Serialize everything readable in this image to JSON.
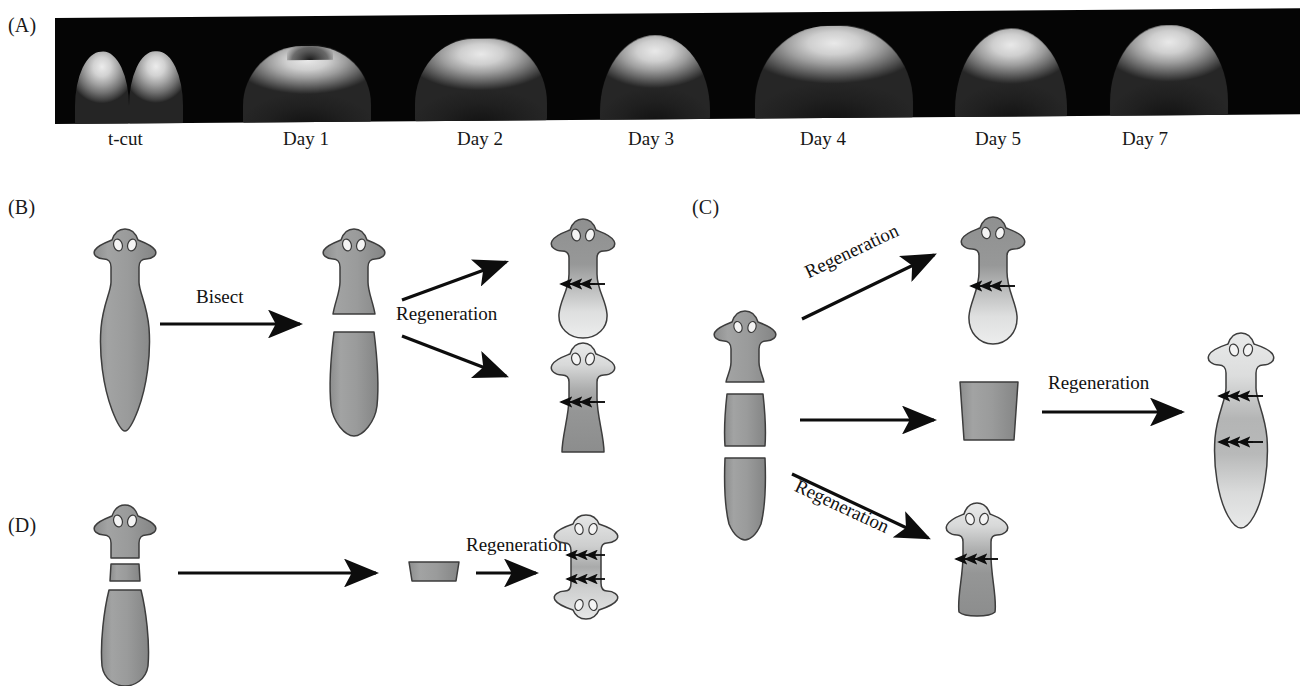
{
  "figure": {
    "panels": [
      {
        "id": "A",
        "letter": "(A)"
      },
      {
        "id": "B",
        "letter": "(B)"
      },
      {
        "id": "C",
        "letter": "(C)"
      },
      {
        "id": "D",
        "letter": "(D)"
      }
    ]
  },
  "panelA": {
    "letter": "(A)",
    "description": "Time-course micrographs of a planarian head regenerating after a transverse t-cut",
    "timepoints": [
      {
        "label": "t-cut",
        "x": 108
      },
      {
        "label": "Day 1",
        "x": 283
      },
      {
        "label": "Day 2",
        "x": 457
      },
      {
        "label": "Day 3",
        "x": 628
      },
      {
        "label": "Day 4",
        "x": 800
      },
      {
        "label": "Day 5",
        "x": 975
      },
      {
        "label": "Day 7",
        "x": 1122
      }
    ],
    "strip_background": "#050505"
  },
  "panelB": {
    "letter": "(B)",
    "operation_label": "Bisect",
    "regeneration_label": "Regeneration",
    "steps": [
      {
        "name": "intact-worm",
        "caption": "Intact planarian"
      },
      {
        "name": "bisected-worm",
        "caption": "Worm cut into anterior and posterior halves"
      },
      {
        "name": "regenerated-head-fragment",
        "caption": "Head fragment regenerates a new tail",
        "arrows": "down",
        "arrow_count": 3
      },
      {
        "name": "regenerated-tail-fragment",
        "caption": "Tail fragment regenerates a new head",
        "arrows": "up",
        "arrow_count": 3
      }
    ]
  },
  "panelC": {
    "letter": "(C)",
    "regeneration_label_top": "Regeneration",
    "regeneration_label_bottom": "Regeneration",
    "regeneration_label_right": "Regeneration",
    "steps": [
      {
        "name": "trisected-worm",
        "caption": "Worm cut into head, trunk and tail pieces"
      },
      {
        "name": "regenerated-head-piece",
        "caption": "Head piece regenerates a tail",
        "arrows": "down",
        "arrow_count": 3
      },
      {
        "name": "isolated-trunk-fragment",
        "caption": "Isolated trunk fragment"
      },
      {
        "name": "regenerated-tail-piece",
        "caption": "Tail piece regenerates a head",
        "arrows": "up",
        "arrow_count": 3
      },
      {
        "name": "regenerated-trunk-worm",
        "caption": "Trunk fragment regenerates both head and tail",
        "arrows": "up-and-down",
        "arrow_count": 6
      }
    ]
  },
  "panelD": {
    "letter": "(D)",
    "regeneration_label": "Regeneration",
    "steps": [
      {
        "name": "thin-slice-worm",
        "caption": "Very thin transverse slice excised from worm"
      },
      {
        "name": "isolated-thin-slice",
        "caption": "Isolated thin slice"
      },
      {
        "name": "bipolar-regenerate",
        "caption": "Thin slice regenerates a bipolar two-headed worm",
        "arrows": "bipolar",
        "arrow_count": 6,
        "eye_pairs": 2
      }
    ]
  },
  "colors": {
    "body_gray": "#9a9b9b",
    "body_gray_dark": "#8a8b8b",
    "outline": "#3d3d3d",
    "new_tissue_light": "#e3e3e3",
    "arrow_black": "#0d0d0d",
    "eye_white": "#f2f2f2",
    "strip_black": "#050505",
    "page_background": "#ffffff"
  }
}
